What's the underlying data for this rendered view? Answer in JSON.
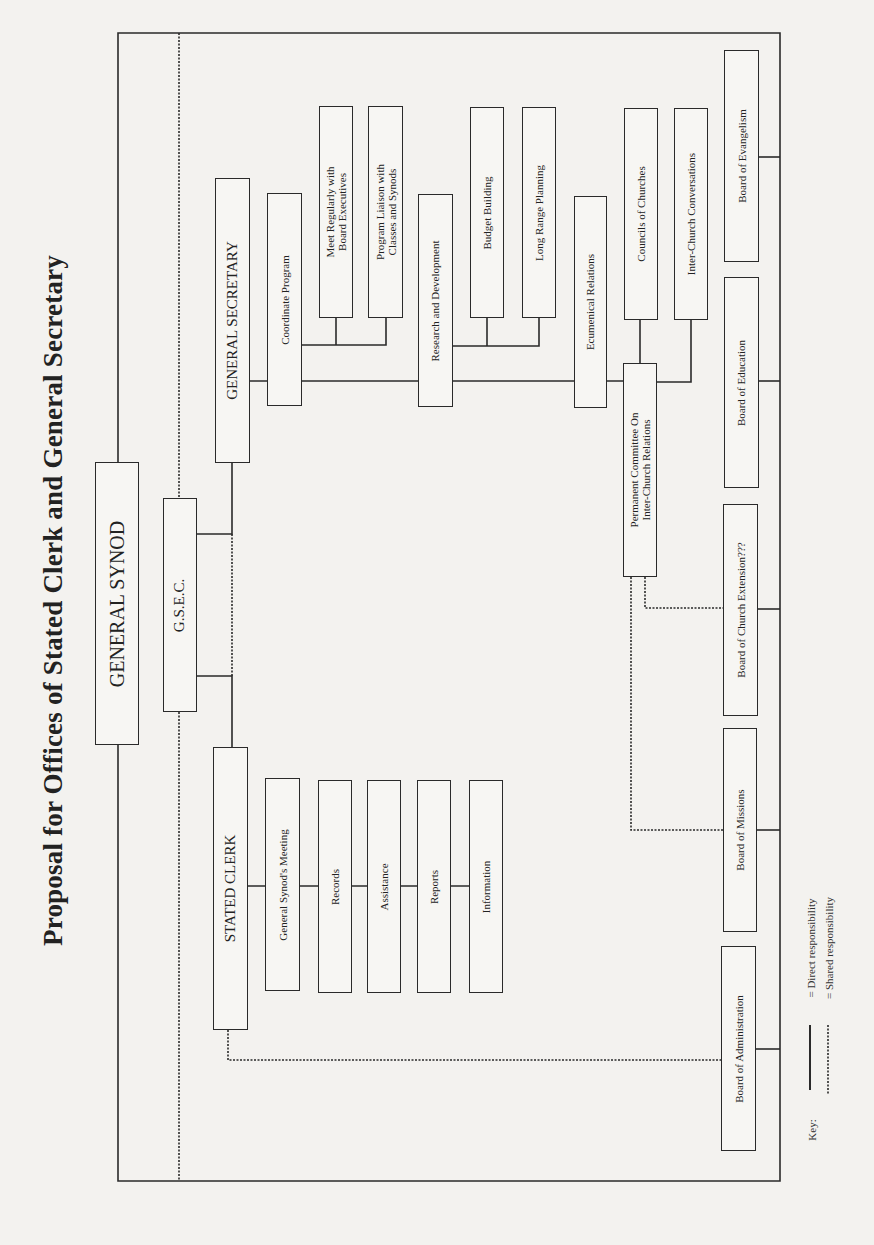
{
  "title": "Proposal for Offices of Stated Clerk and General Secretary",
  "nodes": {
    "general_synod": "GENERAL SYNOD",
    "gsec": "G.S.E.C.",
    "general_secretary": "GENERAL SECRETARY",
    "stated_clerk": "STATED CLERK",
    "coordinate_program": "Coordinate Program",
    "meet_regularly": "Meet Regularly with\nBoard Executives",
    "program_liaison": "Program Liaison with\nClasses and Synods",
    "research_development": "Research and Development",
    "budget_building": "Budget Building",
    "long_range_planning": "Long Range Planning",
    "ecumenical_relations": "Ecumenical Relations",
    "councils_of_churches": "Councils of Churches",
    "inter_church_conversations": "Inter-Church Conversations",
    "permanent_committee": "Permanent Committee On\nInter-Church Relations",
    "general_synods_meeting": "General Synod's Meeting",
    "records": "Records",
    "assistance": "Assistance",
    "reports": "Reports",
    "information": "Information",
    "board_evangelism": "Board of Evangelism",
    "board_education": "Board of Education",
    "board_church_extension": "Board of Church Extension???",
    "board_missions": "Board of Missions",
    "board_administration": "Board of Administration"
  },
  "key": {
    "label": "Key:",
    "direct": "= Direct responsibility",
    "shared": "= Shared responsibility"
  },
  "colors": {
    "ink": "#2a2a2a",
    "paper": "#f3f2ef"
  }
}
